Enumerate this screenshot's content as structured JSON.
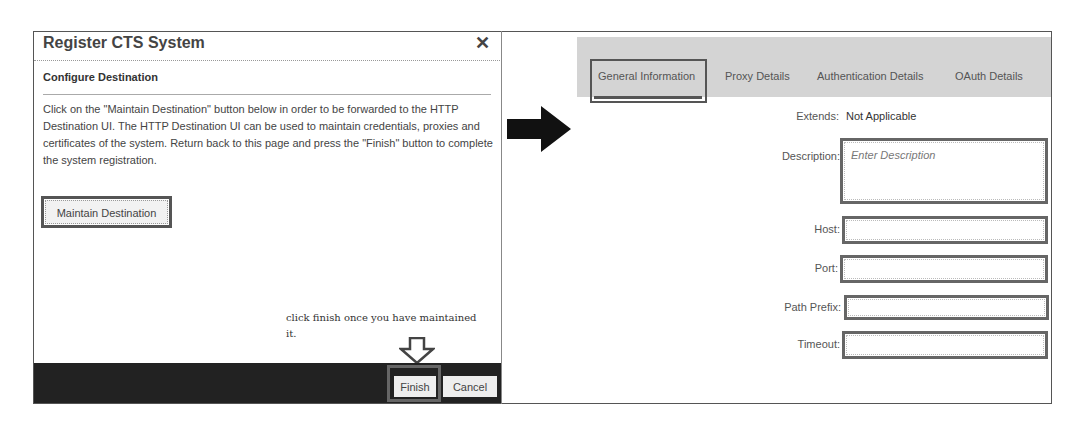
{
  "dialog": {
    "title": "Register CTS System",
    "close_icon": "close-icon",
    "section_title": "Configure Destination",
    "instructions": "Click on the \"Maintain Destination\" button below in order to be forwarded to the HTTP Destination UI. The HTTP Destination UI can be used to maintain credentials, proxies and certificates of the system. Return back to this page and press the \"Finish\" button to complete the system registration.",
    "maintain_button": "Maintain Destination",
    "annotation": "click finish once you have maintained it.",
    "annotation_icon": "hollow-down-arrow-icon",
    "footer": {
      "finish_button": "Finish",
      "cancel_button": "Cancel"
    }
  },
  "transition_icon": "right-arrow-icon",
  "destination": {
    "tabs": [
      {
        "label": "General Information",
        "active": true
      },
      {
        "label": "Proxy Details",
        "active": false
      },
      {
        "label": "Authentication Details",
        "active": false
      },
      {
        "label": "OAuth Details",
        "active": false
      }
    ],
    "form": {
      "extends_label": "Extends",
      "extends_value": "Not Applicable",
      "description_label": "Description",
      "description_placeholder": "Enter Description",
      "description_value": "",
      "host_label": "Host",
      "host_value": "",
      "port_label": "Port",
      "port_value": "",
      "path_prefix_label": "Path Prefix",
      "path_prefix_value": "",
      "timeout_label": "Timeout",
      "timeout_value": ""
    }
  },
  "colors": {
    "footer_bg": "#222222",
    "tab_bar_bg": "#d4d4d4",
    "highlight_border": "#555555"
  }
}
